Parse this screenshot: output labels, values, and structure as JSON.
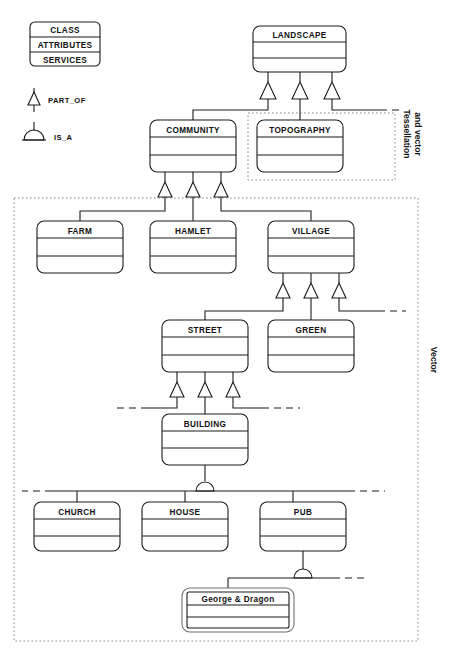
{
  "diagram": {
    "legend": {
      "class_box": {
        "name_row": "CLASS",
        "attributes_row": "ATTRIBUTES",
        "services_row": "SERVICES"
      },
      "symbols": [
        {
          "key": "part_of",
          "label": "PART_OF",
          "glyph": "triangle-icon"
        },
        {
          "key": "is_a",
          "label": "IS_A",
          "glyph": "arc-dome-icon"
        }
      ]
    },
    "regions": [
      {
        "key": "tessellation_and_vector",
        "label": "Tessellation and vector",
        "label_line1": "Tessellation",
        "label_line2": "and vector"
      },
      {
        "key": "vector",
        "label": "Vector",
        "label_line1": "Vector",
        "label_line2": ""
      }
    ],
    "classes": [
      {
        "key": "landscape",
        "label": "LANDSCAPE"
      },
      {
        "key": "community",
        "label": "COMMUNITY"
      },
      {
        "key": "topography",
        "label": "TOPOGRAPHY"
      },
      {
        "key": "farm",
        "label": "FARM"
      },
      {
        "key": "hamlet",
        "label": "HAMLET"
      },
      {
        "key": "village",
        "label": "VILLAGE"
      },
      {
        "key": "street",
        "label": "STREET"
      },
      {
        "key": "green",
        "label": "GREEN"
      },
      {
        "key": "building",
        "label": "BUILDING"
      },
      {
        "key": "church",
        "label": "CHURCH"
      },
      {
        "key": "house",
        "label": "HOUSE"
      },
      {
        "key": "pub",
        "label": "PUB"
      }
    ],
    "instances": [
      {
        "key": "george_and_dragon",
        "label": "George & Dragon"
      }
    ],
    "relationships": [
      {
        "from": "community",
        "to": "landscape",
        "type": "PART_OF"
      },
      {
        "from": "topography",
        "to": "landscape",
        "type": "PART_OF"
      },
      {
        "from": "other_top",
        "to": "landscape",
        "type": "PART_OF"
      },
      {
        "from": "farm",
        "to": "community",
        "type": "PART_OF"
      },
      {
        "from": "hamlet",
        "to": "community",
        "type": "PART_OF"
      },
      {
        "from": "village",
        "to": "community",
        "type": "PART_OF"
      },
      {
        "from": "street",
        "to": "village",
        "type": "PART_OF"
      },
      {
        "from": "green",
        "to": "village",
        "type": "PART_OF"
      },
      {
        "from": "other_vil",
        "to": "village",
        "type": "PART_OF"
      },
      {
        "from": "other_st1",
        "to": "street",
        "type": "PART_OF"
      },
      {
        "from": "building",
        "to": "street",
        "type": "PART_OF"
      },
      {
        "from": "other_st2",
        "to": "street",
        "type": "PART_OF"
      },
      {
        "from": "church",
        "to": "building",
        "type": "IS_A"
      },
      {
        "from": "house",
        "to": "building",
        "type": "IS_A"
      },
      {
        "from": "pub",
        "to": "building",
        "type": "IS_A"
      },
      {
        "from": "george_and_dragon",
        "to": "pub",
        "type": "IS_A"
      }
    ],
    "colors": {
      "line": "#1a1a1a",
      "region_line": "#8a8a8a",
      "background": "#ffffff",
      "text": "#111111"
    }
  }
}
